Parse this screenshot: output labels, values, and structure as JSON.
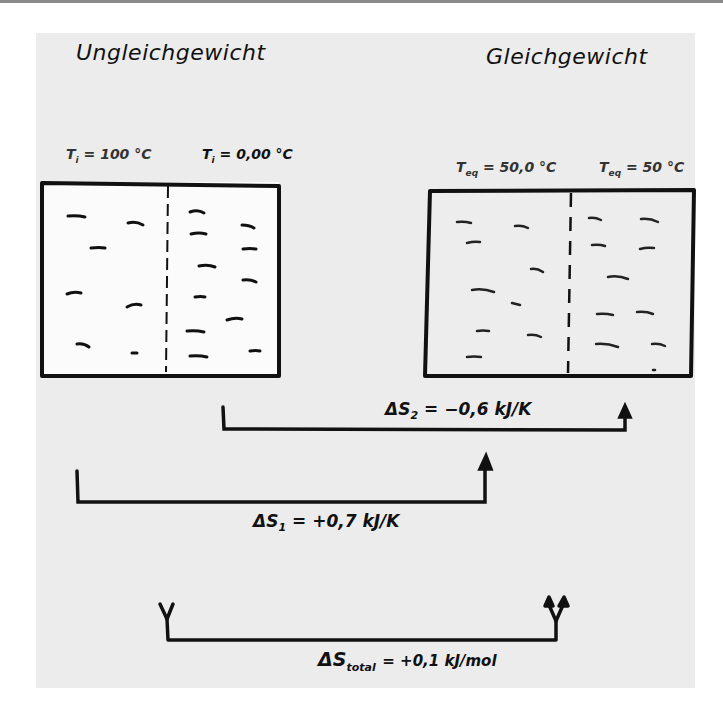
{
  "diagram": {
    "type": "hand-drawn-thermodynamics-sketch",
    "left_panel": {
      "title": "Ungleichgewicht",
      "temp_left": {
        "symbol": "T",
        "subscript": "i",
        "value": "= 100 °C"
      },
      "temp_right": {
        "symbol": "T",
        "subscript": "i",
        "value": "= 0,00 °C"
      },
      "description": "Box divided by dashed wall; few molecules (dashes) on left, many on right"
    },
    "right_panel": {
      "title": "Gleichgewicht",
      "temp_left": {
        "symbol": "T",
        "subscript": "eq",
        "value": "= 50,0 °C"
      },
      "temp_right": {
        "symbol": "T",
        "subscript": "eq",
        "value": "= 50 °C"
      },
      "description": "Box divided by dashed wall; molecules evenly distributed"
    },
    "arrows": [
      {
        "id": "delta-s2",
        "symbol": "ΔS",
        "subscript": "2",
        "value": "= −0,6 kJ/K",
        "from": "left-box-right-half",
        "to": "right-box-right-half"
      },
      {
        "id": "delta-s1",
        "symbol": "ΔS",
        "subscript": "1",
        "value": "= +0,7 kJ/K",
        "from": "left-box-left-half",
        "to": "right-box-left-half"
      },
      {
        "id": "delta-s-total",
        "symbol": "ΔS",
        "subscript": "total",
        "value": "= +0,1 kJ/mol",
        "from": "left-system",
        "to": "right-system"
      }
    ],
    "colors": {
      "ink": "#111111",
      "paper": "#ececec",
      "box_interior": "#fbfbfb",
      "background": "#ffffff"
    }
  }
}
